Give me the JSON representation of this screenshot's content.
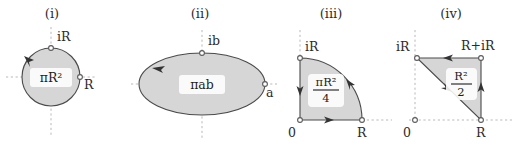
{
  "figure": {
    "background_color": "#ffffff",
    "shape_fill_color": "#d6d6d6",
    "shape_stroke_color": "#4a4a4a",
    "axis_dash_color": "#b9b9b9",
    "text_color": "#2b2b2b"
  },
  "panels": [
    {
      "id": "panel-i",
      "title": "(i)",
      "shape": "circle",
      "area_label": "πR²",
      "orientation": "counterclockwise",
      "markers": [
        {
          "name": "top",
          "label": "iR"
        },
        {
          "name": "right",
          "label": "R"
        }
      ]
    },
    {
      "id": "panel-ii",
      "title": "(ii)",
      "shape": "ellipse",
      "area_label": "πab",
      "orientation": "counterclockwise",
      "markers": [
        {
          "name": "top",
          "label": "ib"
        },
        {
          "name": "right",
          "label": "a"
        }
      ]
    },
    {
      "id": "panel-iii",
      "title": "(iii)",
      "shape": "quarter-disc",
      "area_label_numerator": "πR²",
      "area_label_denominator": "4",
      "orientation": "counterclockwise",
      "markers": [
        {
          "name": "top",
          "label": "iR"
        },
        {
          "name": "origin",
          "label": "0"
        },
        {
          "name": "right",
          "label": "R"
        }
      ]
    },
    {
      "id": "panel-iv",
      "title": "(iv)",
      "shape": "triangle",
      "area_label_numerator": "R²",
      "area_label_denominator": "2",
      "orientation": "counterclockwise",
      "markers": [
        {
          "name": "top-left",
          "label": "iR"
        },
        {
          "name": "top-right",
          "label": "R+iR"
        },
        {
          "name": "origin",
          "label": "0"
        },
        {
          "name": "bottom-right",
          "label": "R"
        }
      ]
    }
  ]
}
